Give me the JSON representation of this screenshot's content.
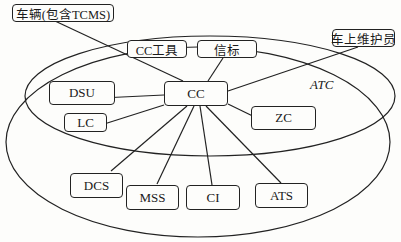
{
  "diagram": {
    "container_label": "ATC",
    "center": {
      "id": "cc",
      "label": "CC"
    },
    "nodes": [
      {
        "id": "vehicle",
        "label": "车辆(包含TCMS)"
      },
      {
        "id": "cc_tool",
        "label": "CC工具"
      },
      {
        "id": "beacon",
        "label": "信标"
      },
      {
        "id": "onboard_maint",
        "label": "车上维护员"
      },
      {
        "id": "dsu",
        "label": "DSU"
      },
      {
        "id": "lc",
        "label": "LC"
      },
      {
        "id": "zc",
        "label": "ZC"
      },
      {
        "id": "dcs",
        "label": "DCS"
      },
      {
        "id": "mss",
        "label": "MSS"
      },
      {
        "id": "ci",
        "label": "CI"
      },
      {
        "id": "ats",
        "label": "ATS"
      }
    ],
    "edges": [
      [
        "cc",
        "vehicle"
      ],
      [
        "cc",
        "beacon"
      ],
      [
        "cc",
        "onboard_maint"
      ],
      [
        "cc",
        "dsu"
      ],
      [
        "cc",
        "lc"
      ],
      [
        "cc",
        "zc"
      ],
      [
        "cc",
        "dcs"
      ],
      [
        "cc",
        "mss"
      ],
      [
        "cc",
        "ci"
      ],
      [
        "cc",
        "ats"
      ]
    ]
  }
}
